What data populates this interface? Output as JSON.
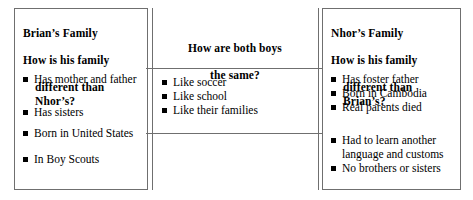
{
  "diagram": {
    "colors": {
      "border": "#6f6f6f",
      "text": "#000000",
      "bullet": "#000000",
      "background": "#ffffff"
    },
    "left_panel": {
      "header_lines": [
        "Brian’s Family",
        "How is his family",
        "different than Nhor’s?"
      ],
      "items": [
        "Has mother and father",
        "Has sisters",
        "Born in United States",
        "In Boy Scouts"
      ]
    },
    "middle_panel": {
      "header_lines": [
        "How are both boys",
        "the same?"
      ],
      "items": [
        "Like soccer",
        "Like school",
        "Like their families"
      ]
    },
    "right_panel": {
      "header_lines": [
        "Nhor’s Family",
        "How is his family",
        "different than Brian’s?"
      ],
      "items": [
        "Has foster father",
        "Born in Cambodia",
        "Real parents died",
        "Had to learn another",
        "No brothers or sisters"
      ],
      "item_continuations": {
        "3": "language and customs"
      }
    }
  }
}
